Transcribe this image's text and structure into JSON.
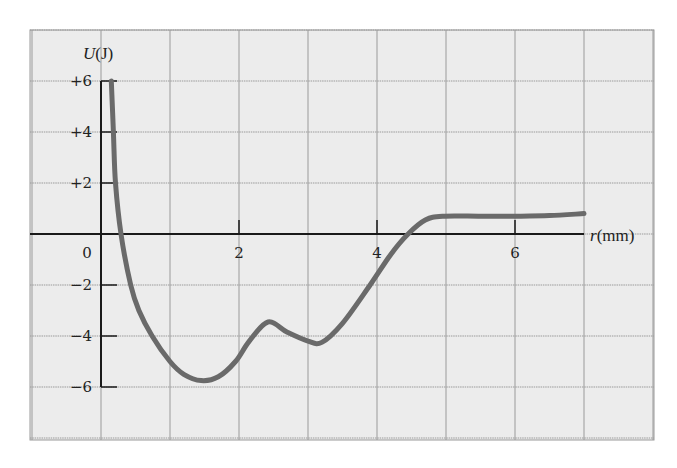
{
  "chart_data": {
    "type": "line",
    "title": "",
    "xlabel": "r(mm)",
    "ylabel": "U(J)",
    "ylabel_var": "U",
    "ylabel_unit": "(J)",
    "xlabel_var": "r",
    "xlabel_unit": "(mm)",
    "xlim": [
      -1,
      8
    ],
    "ylim": [
      -8,
      8
    ],
    "grid": true,
    "x_ticks": [
      {
        "value": 0,
        "label": "0"
      },
      {
        "value": 2,
        "label": "2"
      },
      {
        "value": 4,
        "label": "4"
      },
      {
        "value": 6,
        "label": "6"
      }
    ],
    "y_ticks": [
      {
        "value": 6,
        "label": "+6"
      },
      {
        "value": 4,
        "label": "+4"
      },
      {
        "value": 2,
        "label": "+2"
      },
      {
        "value": -2,
        "label": "−2"
      },
      {
        "value": -4,
        "label": "−4"
      },
      {
        "value": -6,
        "label": "−6"
      }
    ],
    "series": [
      {
        "name": "U(r)",
        "points": [
          [
            0.15,
            6.0
          ],
          [
            0.18,
            4.0
          ],
          [
            0.21,
            2.0
          ],
          [
            0.29,
            0.0
          ],
          [
            0.43,
            -2.0
          ],
          [
            0.55,
            -3.0
          ],
          [
            0.74,
            -4.0
          ],
          [
            1.0,
            -5.0
          ],
          [
            1.2,
            -5.5
          ],
          [
            1.45,
            -5.75
          ],
          [
            1.7,
            -5.6
          ],
          [
            1.95,
            -5.0
          ],
          [
            2.15,
            -4.2
          ],
          [
            2.42,
            -3.45
          ],
          [
            2.7,
            -3.85
          ],
          [
            3.0,
            -4.2
          ],
          [
            3.2,
            -4.25
          ],
          [
            3.5,
            -3.5
          ],
          [
            3.9,
            -2.0
          ],
          [
            4.2,
            -0.8
          ],
          [
            4.45,
            0.0
          ],
          [
            4.7,
            0.55
          ],
          [
            4.95,
            0.7
          ],
          [
            5.5,
            0.7
          ],
          [
            6.0,
            0.7
          ],
          [
            6.5,
            0.72
          ],
          [
            7.0,
            0.8
          ]
        ]
      }
    ]
  },
  "colors": {
    "background": "#ececec",
    "grid": "#9a9a9a",
    "axis": "#1a1a1a",
    "curve": "#6a6a6a"
  }
}
